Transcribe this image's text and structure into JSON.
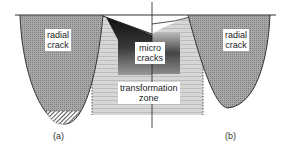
{
  "diagram": {
    "labels": {
      "radial_crack_left": [
        "radial",
        "crack"
      ],
      "micro_cracks": [
        "micro",
        "cracks"
      ],
      "transformation_zone": [
        "transformation",
        "zone"
      ],
      "radial_crack_right": [
        "radial",
        "crack"
      ]
    },
    "captions": {
      "a": "(a)",
      "b": "(b)"
    },
    "colors": {
      "crack_fill": "#9a9a9a",
      "zone_fill": "#d2d2d2",
      "microcrack_dark": "#111111",
      "outline": "#333333",
      "background": "#ffffff"
    }
  }
}
